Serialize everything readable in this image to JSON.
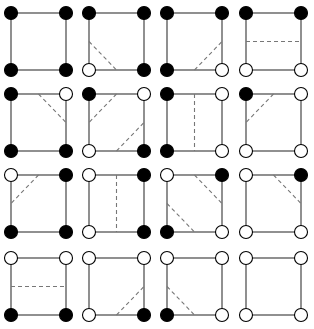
{
  "diagram": {
    "type": "marching-squares-cases",
    "rows": 4,
    "cols": 4,
    "colors": {
      "edge": "#555555",
      "contour": "#777777",
      "filled": "#000000",
      "empty": "#ffffff",
      "background": "#ffffff"
    },
    "layout": {
      "col_x": [
        11,
        89,
        167,
        246
      ],
      "row_y": [
        13,
        94,
        175,
        258
      ],
      "cell_w": 55,
      "cell_h": 57,
      "vertex_r": 6.5
    },
    "cases": [
      {
        "corners": {
          "tl": 1,
          "tr": 1,
          "bl": 1,
          "br": 1
        },
        "contours": []
      },
      {
        "corners": {
          "tl": 1,
          "tr": 1,
          "bl": 0,
          "br": 1
        },
        "contours": [
          [
            "l",
            "b"
          ]
        ]
      },
      {
        "corners": {
          "tl": 1,
          "tr": 1,
          "bl": 1,
          "br": 0
        },
        "contours": [
          [
            "b",
            "r"
          ]
        ]
      },
      {
        "corners": {
          "tl": 1,
          "tr": 1,
          "bl": 0,
          "br": 0
        },
        "contours": [
          [
            "l",
            "r"
          ]
        ]
      },
      {
        "corners": {
          "tl": 1,
          "tr": 0,
          "bl": 1,
          "br": 1
        },
        "contours": [
          [
            "t",
            "r"
          ]
        ]
      },
      {
        "corners": {
          "tl": 1,
          "tr": 0,
          "bl": 0,
          "br": 1
        },
        "contours": [
          [
            "t",
            "l"
          ],
          [
            "b",
            "r"
          ]
        ]
      },
      {
        "corners": {
          "tl": 1,
          "tr": 0,
          "bl": 1,
          "br": 0
        },
        "contours": [
          [
            "t",
            "b"
          ]
        ]
      },
      {
        "corners": {
          "tl": 1,
          "tr": 0,
          "bl": 0,
          "br": 0
        },
        "contours": [
          [
            "t",
            "l"
          ]
        ]
      },
      {
        "corners": {
          "tl": 0,
          "tr": 1,
          "bl": 1,
          "br": 1
        },
        "contours": [
          [
            "t",
            "l"
          ]
        ]
      },
      {
        "corners": {
          "tl": 0,
          "tr": 1,
          "bl": 0,
          "br": 1
        },
        "contours": [
          [
            "t",
            "b"
          ]
        ]
      },
      {
        "corners": {
          "tl": 0,
          "tr": 1,
          "bl": 1,
          "br": 0
        },
        "contours": [
          [
            "t",
            "r"
          ],
          [
            "l",
            "b"
          ]
        ]
      },
      {
        "corners": {
          "tl": 0,
          "tr": 1,
          "bl": 0,
          "br": 0
        },
        "contours": [
          [
            "t",
            "r"
          ]
        ]
      },
      {
        "corners": {
          "tl": 0,
          "tr": 0,
          "bl": 1,
          "br": 1
        },
        "contours": [
          [
            "l",
            "r"
          ]
        ]
      },
      {
        "corners": {
          "tl": 0,
          "tr": 0,
          "bl": 0,
          "br": 1
        },
        "contours": [
          [
            "b",
            "r"
          ]
        ]
      },
      {
        "corners": {
          "tl": 0,
          "tr": 0,
          "bl": 1,
          "br": 0
        },
        "contours": [
          [
            "l",
            "b"
          ]
        ]
      },
      {
        "corners": {
          "tl": 0,
          "tr": 0,
          "bl": 0,
          "br": 0
        },
        "contours": []
      }
    ]
  }
}
